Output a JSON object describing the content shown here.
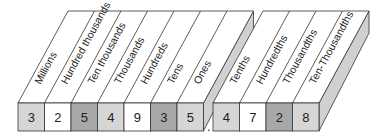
{
  "diagram": {
    "title": "Place value chart",
    "whole_block": {
      "places": [
        {
          "label": "Millions",
          "digit": "3",
          "shade": "#d6d6d6"
        },
        {
          "label": "Hundred thousands",
          "digit": "2",
          "shade": "#ffffff"
        },
        {
          "label": "Ten thousands",
          "digit": "5",
          "shade": "#a8a8a8"
        },
        {
          "label": "Thousands",
          "digit": "4",
          "shade": "#d6d6d6"
        },
        {
          "label": "Hundreds",
          "digit": "9",
          "shade": "#ffffff"
        },
        {
          "label": "Tens",
          "digit": "3",
          "shade": "#a8a8a8"
        },
        {
          "label": "Ones",
          "digit": "5",
          "shade": "#d6d6d6"
        }
      ]
    },
    "decimal_point": ".",
    "decimal_block": {
      "places": [
        {
          "label": "Tenths",
          "digit": "4",
          "shade": "#d6d6d6"
        },
        {
          "label": "Hundredths",
          "digit": "7",
          "shade": "#ffffff"
        },
        {
          "label": "Thousandths",
          "digit": "2",
          "shade": "#a8a8a8"
        },
        {
          "label": "Ten-Thousandths",
          "digit": "8",
          "shade": "#d6d6d6"
        }
      ]
    },
    "colors": {
      "line": "#333333",
      "side": "#d0d0d0",
      "top": "#ffffff"
    }
  }
}
